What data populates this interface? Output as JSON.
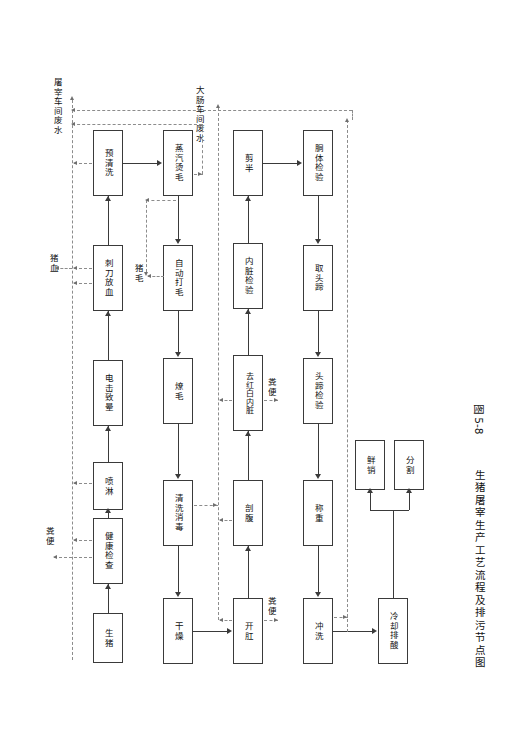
{
  "figure": {
    "caption_number": "图 5-8",
    "caption_title": "生猪屠宰生产工艺流程及排污节点图",
    "caption_full": "图 5-8  生猪屠宰生产工艺流程及排污节点图"
  },
  "colors": {
    "box_border": "#3a3a3a",
    "solid_line": "#3a3a3a",
    "dashed_line": "#8c8c8c",
    "text": "#111111",
    "background": "#ffffff"
  },
  "diagram": {
    "type": "process-flowchart",
    "orientation": "rotated-90-ccw",
    "rows": [
      {
        "id": "row1",
        "nodes": [
          "生猪",
          "健康检查",
          "喷淋",
          "电击致晕",
          "刺刀放血",
          "预清洗"
        ]
      },
      {
        "id": "row2",
        "nodes": [
          "干燥",
          "清洗消毒",
          "燎毛",
          "自动打毛",
          "蒸汽烫毛"
        ]
      },
      {
        "id": "row3",
        "nodes": [
          "开肛",
          "剖腹",
          "去红白内脏",
          "内脏检验",
          "剪半"
        ]
      },
      {
        "id": "row4",
        "nodes": [
          "冲洗",
          "称重",
          "头蹄检验",
          "取头蹄",
          "胴体检验"
        ]
      },
      {
        "id": "row5",
        "nodes": [
          "冷却排酸",
          "鲜销",
          "分割"
        ]
      }
    ],
    "nodes": [
      {
        "id": "n_shengzhu",
        "label": "生猪"
      },
      {
        "id": "n_jiankangjiancha",
        "label": "健康检查"
      },
      {
        "id": "n_penlin",
        "label": "喷淋"
      },
      {
        "id": "n_dianjizhiyun",
        "label": "电击致晕"
      },
      {
        "id": "n_cidaofangxue",
        "label": "刺刀放血"
      },
      {
        "id": "n_yuqingxi",
        "label": "预清洗"
      },
      {
        "id": "n_zhengqitangmao",
        "label": "蒸汽烫毛"
      },
      {
        "id": "n_zidongdamao",
        "label": "自动打毛"
      },
      {
        "id": "n_liaomao",
        "label": "燎毛"
      },
      {
        "id": "n_qingxixiaodu",
        "label": "清洗消毒"
      },
      {
        "id": "n_ganzao",
        "label": "干燥"
      },
      {
        "id": "n_kaigang",
        "label": "开肛"
      },
      {
        "id": "n_poufu",
        "label": "剖腹"
      },
      {
        "id": "n_quhongbai",
        "label": "去红白内脏"
      },
      {
        "id": "n_neizangjianyan",
        "label": "内脏检验"
      },
      {
        "id": "n_jianban",
        "label": "剪半"
      },
      {
        "id": "n_dongtijianyan",
        "label": "胴体检验"
      },
      {
        "id": "n_qutoudi",
        "label": "取头蹄"
      },
      {
        "id": "n_toudijianyan",
        "label": "头蹄检验"
      },
      {
        "id": "n_chengzhong",
        "label": "称重"
      },
      {
        "id": "n_chongxi",
        "label": "冲洗"
      },
      {
        "id": "n_lengquepaisuan",
        "label": "冷却排酸"
      },
      {
        "id": "n_xianxiao",
        "label": "鲜销"
      },
      {
        "id": "n_fenge",
        "label": "分割"
      }
    ],
    "pollution_labels": [
      {
        "id": "p_tuzaifeishui",
        "label": "屠宰车间废水"
      },
      {
        "id": "p_dachangfeishui",
        "label": "大肠车间废水"
      },
      {
        "id": "p_zhuxue",
        "label": "猪血"
      },
      {
        "id": "p_zhumao",
        "label": "猪毛"
      },
      {
        "id": "p_fenbian_1",
        "label": "粪便"
      },
      {
        "id": "p_fenbian_2",
        "label": "粪便"
      },
      {
        "id": "p_fenbian_3",
        "label": "粪便"
      }
    ]
  }
}
